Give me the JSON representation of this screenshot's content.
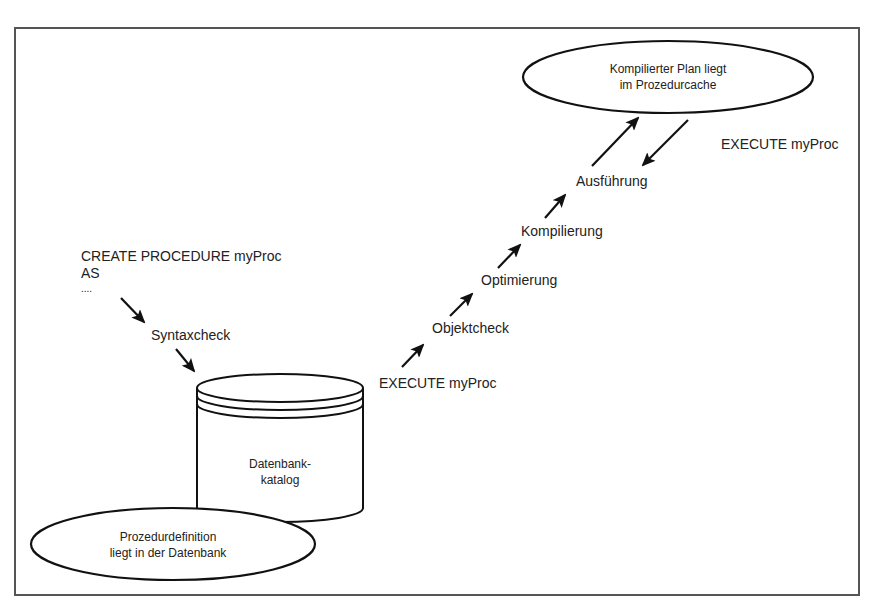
{
  "diagram": {
    "type": "flow",
    "title": "",
    "nodes": {
      "plan_cache": {
        "line1": "Kompilierter Plan liegt",
        "line2": "im Prozedurcache",
        "shape": "ellipse"
      },
      "proc_def": {
        "line1": "Prozedurdefinition",
        "line2": "liegt in der Datenbank",
        "shape": "ellipse"
      },
      "catalog": {
        "line1": "Datenbank-",
        "line2": "katalog",
        "shape": "cylinder"
      }
    },
    "create_code": {
      "line1": "CREATE PROCEDURE myProc",
      "line2": "AS",
      "line3": "...."
    },
    "steps": {
      "syntaxcheck": "Syntaxcheck",
      "execute_left": "EXECUTE myProc",
      "objektcheck": "Objektcheck",
      "optimierung": "Optimierung",
      "kompilierung": "Kompilierung",
      "ausfuehrung": "Ausführung",
      "execute_right": "EXECUTE myProc"
    },
    "edges": [
      {
        "from": "create_code",
        "to": "syntaxcheck"
      },
      {
        "from": "syntaxcheck",
        "to": "catalog"
      },
      {
        "from": "execute_left",
        "to": "objektcheck"
      },
      {
        "from": "objektcheck",
        "to": "optimierung"
      },
      {
        "from": "optimierung",
        "to": "kompilierung"
      },
      {
        "from": "kompilierung",
        "to": "ausfuehrung"
      },
      {
        "from": "ausfuehrung",
        "to": "plan_cache"
      },
      {
        "from": "plan_cache",
        "to": "ausfuehrung",
        "label": "EXECUTE myProc"
      }
    ]
  }
}
